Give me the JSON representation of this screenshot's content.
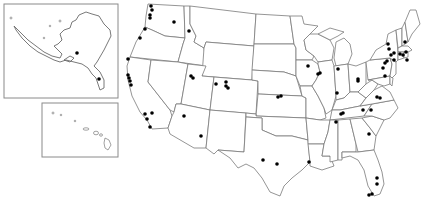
{
  "map": {
    "title": "",
    "type": "point map",
    "region": "United States",
    "colors": {
      "background": "#ffffff",
      "border": "#7a7a7a",
      "inset_frame": "#8a8a8a",
      "marker": "#000000"
    },
    "insets": [
      {
        "name": "Alaska",
        "frame": {
          "x": 4,
          "y": 4,
          "w": 114,
          "h": 94
        }
      },
      {
        "name": "Hawaii",
        "frame": {
          "x": 42,
          "y": 103,
          "w": 76,
          "h": 54
        }
      }
    ],
    "points": [
      {
        "region": "Alaska",
        "x": 77,
        "y": 53
      },
      {
        "region": "Alaska",
        "x": 99,
        "y": 79
      },
      {
        "region": "Washington",
        "x": 151,
        "y": 6
      },
      {
        "region": "Washington",
        "x": 152,
        "y": 10
      },
      {
        "region": "Washington",
        "x": 150,
        "y": 15
      },
      {
        "region": "Washington",
        "x": 150,
        "y": 18
      },
      {
        "region": "Washington",
        "x": 174,
        "y": 22
      },
      {
        "region": "Oregon",
        "x": 145,
        "y": 29
      },
      {
        "region": "Oregon",
        "x": 140,
        "y": 38
      },
      {
        "region": "Idaho",
        "x": 189,
        "y": 31
      },
      {
        "region": "California",
        "x": 128,
        "y": 59
      },
      {
        "region": "California",
        "x": 128,
        "y": 75
      },
      {
        "region": "California",
        "x": 129,
        "y": 78
      },
      {
        "region": "California",
        "x": 130,
        "y": 81
      },
      {
        "region": "California",
        "x": 131,
        "y": 85
      },
      {
        "region": "California",
        "x": 145,
        "y": 114
      },
      {
        "region": "California",
        "x": 152,
        "y": 113
      },
      {
        "region": "California",
        "x": 147,
        "y": 119
      },
      {
        "region": "California",
        "x": 150,
        "y": 127
      },
      {
        "region": "Utah",
        "x": 191,
        "y": 76
      },
      {
        "region": "Utah",
        "x": 193,
        "y": 78
      },
      {
        "region": "Colorado",
        "x": 216,
        "y": 84
      },
      {
        "region": "Colorado",
        "x": 226,
        "y": 82
      },
      {
        "region": "Colorado",
        "x": 226,
        "y": 86
      },
      {
        "region": "Colorado",
        "x": 228,
        "y": 88
      },
      {
        "region": "Arizona",
        "x": 184,
        "y": 116
      },
      {
        "region": "New Mexico",
        "x": 201,
        "y": 136
      },
      {
        "region": "Missouri",
        "x": 278,
        "y": 97
      },
      {
        "region": "Missouri",
        "x": 281,
        "y": 96
      },
      {
        "region": "Texas",
        "x": 263,
        "y": 160
      },
      {
        "region": "Texas",
        "x": 277,
        "y": 164
      },
      {
        "region": "Louisiana",
        "x": 309,
        "y": 162
      },
      {
        "region": "Wisconsin",
        "x": 308,
        "y": 66
      },
      {
        "region": "Illinois",
        "x": 318,
        "y": 74
      },
      {
        "region": "Illinois",
        "x": 320,
        "y": 73
      },
      {
        "region": "Michigan",
        "x": 338,
        "y": 69
      },
      {
        "region": "Indiana",
        "x": 337,
        "y": 93
      },
      {
        "region": "Ohio",
        "x": 358,
        "y": 81
      },
      {
        "region": "Pennsylvania",
        "x": 385,
        "y": 76
      },
      {
        "region": "Pennsylvania",
        "x": 358,
        "y": 79
      },
      {
        "region": "Maryland",
        "x": 377,
        "y": 97
      },
      {
        "region": "Virginia",
        "x": 380,
        "y": 98
      },
      {
        "region": "Tennessee",
        "x": 341,
        "y": 114
      },
      {
        "region": "Tennessee",
        "x": 343,
        "y": 113
      },
      {
        "region": "Tennessee",
        "x": 336,
        "y": 122
      },
      {
        "region": "North Carolina",
        "x": 363,
        "y": 110
      },
      {
        "region": "North Carolina",
        "x": 371,
        "y": 110
      },
      {
        "region": "South Carolina",
        "x": 369,
        "y": 134
      },
      {
        "region": "Florida",
        "x": 377,
        "y": 178
      },
      {
        "region": "Florida",
        "x": 377,
        "y": 184
      },
      {
        "region": "Florida",
        "x": 369,
        "y": 195
      },
      {
        "region": "Florida",
        "x": 372,
        "y": 194
      },
      {
        "region": "New York",
        "x": 388,
        "y": 44
      },
      {
        "region": "New York",
        "x": 389,
        "y": 49
      },
      {
        "region": "New York",
        "x": 391,
        "y": 55
      },
      {
        "region": "New York",
        "x": 394,
        "y": 53
      },
      {
        "region": "New York",
        "x": 385,
        "y": 63
      },
      {
        "region": "New York",
        "x": 387,
        "y": 61
      },
      {
        "region": "New Jersey",
        "x": 383,
        "y": 68
      },
      {
        "region": "Connecticut",
        "x": 394,
        "y": 60
      },
      {
        "region": "Massachusetts",
        "x": 400,
        "y": 54
      },
      {
        "region": "Massachusetts",
        "x": 403,
        "y": 55
      },
      {
        "region": "Massachusetts",
        "x": 406,
        "y": 52
      },
      {
        "region": "Rhode Island",
        "x": 407,
        "y": 60
      },
      {
        "region": "New Hampshire",
        "x": 405,
        "y": 42
      }
    ]
  }
}
